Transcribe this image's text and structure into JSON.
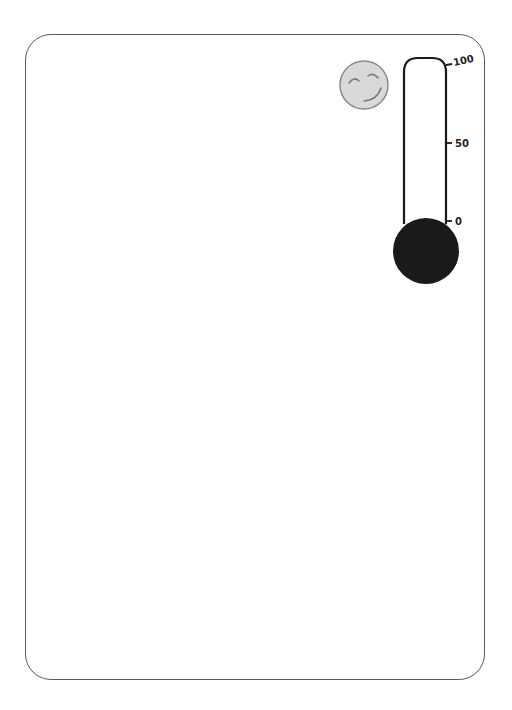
{
  "card": {
    "border_color": "#5a5a5a",
    "background": "#ffffff"
  },
  "smiley": {
    "icon": "smiley-face-icon",
    "fill": "#d9d9d9",
    "stroke": "#8a8a8a"
  },
  "thermometer": {
    "scale_labels": {
      "top": "100",
      "middle": "50",
      "bottom": "0"
    },
    "current_value": 0,
    "bulb_color": "#1a1a1a",
    "tube_stroke": "#1a1a1a"
  }
}
